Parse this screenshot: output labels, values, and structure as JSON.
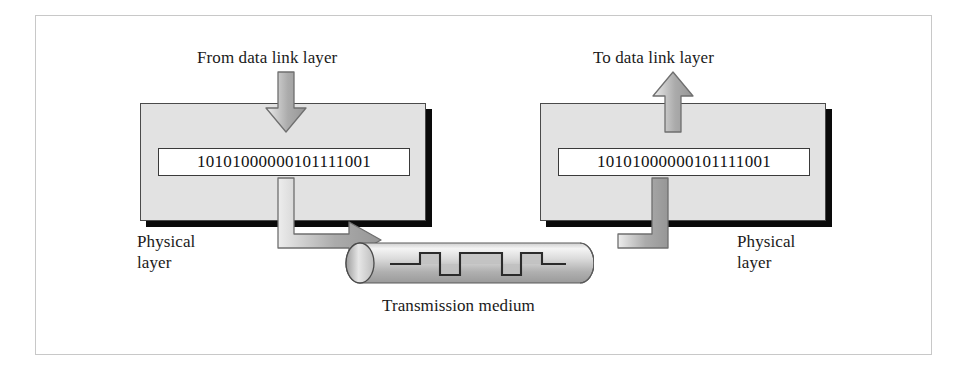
{
  "figure": {
    "background_color": "#ffffff",
    "frame_color": "#c8c8c8"
  },
  "labels": {
    "from_data_link_layer": "From data link layer",
    "to_data_link_layer": "To data link layer",
    "physical_layer_left_line1": "Physical",
    "physical_layer_left_line2": "layer",
    "physical_layer_right_line1": "Physical",
    "physical_layer_right_line2": "layer",
    "transmission_medium": "Transmission medium"
  },
  "sender": {
    "bits": "10101000000101111001",
    "box_fill": "#e2e2e2",
    "box_border": "#4a4a4a",
    "shadow_color": "#0a0a0a"
  },
  "receiver": {
    "bits": "10101000000101111001",
    "box_fill": "#e2e2e2",
    "box_border": "#4a4a4a",
    "shadow_color": "#0a0a0a"
  },
  "arrows": {
    "fill_light": "#e8e8e8",
    "fill_mid": "#b4b4b4",
    "fill_dark": "#8e8e8e",
    "outline": "#6f6f6f",
    "down_into_sender": "down",
    "down_out_of_sender": "down",
    "elbow_sender_to_medium": "down-then-right",
    "elbow_medium_to_receiver": "right-then-up",
    "up_into_receiver": "up",
    "up_out_of_receiver": "up"
  },
  "medium": {
    "shape": "cylinder",
    "fill_light": "#f0f0f0",
    "fill_mid": "#b8b8b8",
    "outline": "#5a5a5a",
    "signal_type": "digital-square-wave",
    "signal_color": "#2b2b2b",
    "signal_pulse_fill": "#c4c4c4",
    "signal_levels": [
      0,
      1,
      0,
      1,
      1,
      0,
      1,
      0,
      0
    ]
  }
}
